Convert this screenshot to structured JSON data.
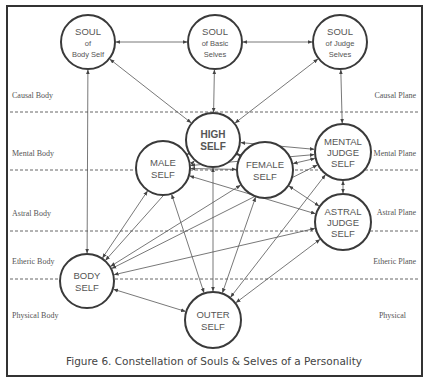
{
  "caption": "Figure 6.  Constellation of Souls & Selves of a Personality",
  "left_labels": [
    {
      "text": "Causal Body",
      "x": 12,
      "y": 98
    },
    {
      "text": "Mental Body",
      "x": 12,
      "y": 156
    },
    {
      "text": "Astral Body",
      "x": 12,
      "y": 216
    },
    {
      "text": "Etheric Body",
      "x": 12,
      "y": 264
    },
    {
      "text": "Physical Body",
      "x": 12,
      "y": 318
    }
  ],
  "right_labels": [
    {
      "text": "Causal Plane",
      "x": 416,
      "y": 98
    },
    {
      "text": "Mental Plane",
      "x": 416,
      "y": 156
    },
    {
      "text": "Astral Plane",
      "x": 416,
      "y": 215
    },
    {
      "text": "Etheric Plane",
      "x": 416,
      "y": 264
    },
    {
      "text": "Physical",
      "x": 406,
      "y": 318
    }
  ],
  "dashed_lines_y": [
    112,
    170,
    231,
    279
  ],
  "nodes": [
    {
      "id": "soul-body",
      "lines": [
        "SOUL",
        "of",
        "Body Self"
      ],
      "cx": 88,
      "cy": 42,
      "r": 27,
      "bold": false
    },
    {
      "id": "soul-basic",
      "lines": [
        "SOUL",
        "of Basic",
        "Selves"
      ],
      "cx": 215,
      "cy": 42,
      "r": 27,
      "bold": false
    },
    {
      "id": "soul-judge",
      "lines": [
        "SOUL",
        "of Judge",
        "Selves"
      ],
      "cx": 340,
      "cy": 42,
      "r": 27,
      "bold": false
    },
    {
      "id": "high-self",
      "lines": [
        "HIGH",
        "SELF"
      ],
      "cx": 213,
      "cy": 140,
      "r": 27,
      "bold": true
    },
    {
      "id": "mental-judge",
      "lines": [
        "MENTAL",
        "JUDGE",
        "SELF"
      ],
      "cx": 343,
      "cy": 152,
      "r": 28,
      "bold": false
    },
    {
      "id": "male-self",
      "lines": [
        "MALE",
        "SELF"
      ],
      "cx": 163,
      "cy": 168,
      "r": 27,
      "bold": false
    },
    {
      "id": "female-self",
      "lines": [
        "FEMALE",
        "SELF"
      ],
      "cx": 265,
      "cy": 170,
      "r": 28,
      "bold": false
    },
    {
      "id": "astral-judge",
      "lines": [
        "ASTRAL",
        "JUDGE",
        "SELF"
      ],
      "cx": 343,
      "cy": 222,
      "r": 28,
      "bold": false
    },
    {
      "id": "body-self",
      "lines": [
        "BODY",
        "SELF"
      ],
      "cx": 87,
      "cy": 281,
      "r": 27,
      "bold": false
    },
    {
      "id": "outer-self",
      "lines": [
        "OUTER",
        "SELF"
      ],
      "cx": 213,
      "cy": 320,
      "r": 28,
      "bold": false
    }
  ],
  "edges": [
    [
      "soul-body",
      "soul-basic"
    ],
    [
      "soul-basic",
      "soul-judge"
    ],
    [
      "soul-body",
      "high-self"
    ],
    [
      "soul-basic",
      "high-self"
    ],
    [
      "soul-judge",
      "high-self"
    ],
    [
      "soul-judge",
      "mental-judge"
    ],
    [
      "soul-body",
      "body-self"
    ],
    [
      "high-self",
      "male-self"
    ],
    [
      "high-self",
      "female-self"
    ],
    [
      "high-self",
      "mental-judge"
    ],
    [
      "high-self",
      "outer-self"
    ],
    [
      "mental-judge",
      "male-self"
    ],
    [
      "mental-judge",
      "female-self"
    ],
    [
      "astral-judge",
      "male-self"
    ],
    [
      "astral-judge",
      "female-self"
    ],
    [
      "female-self",
      "male-self"
    ],
    [
      "mental-judge",
      "astral-judge"
    ],
    [
      "male-self",
      "body-self"
    ],
    [
      "male-self",
      "outer-self"
    ],
    [
      "female-self",
      "body-self"
    ],
    [
      "female-self",
      "outer-self"
    ],
    [
      "mental-judge",
      "body-self"
    ],
    [
      "mental-judge",
      "outer-self"
    ],
    [
      "astral-judge",
      "body-self"
    ],
    [
      "astral-judge",
      "outer-self"
    ],
    [
      "high-self",
      "body-self"
    ],
    [
      "body-self",
      "outer-self"
    ]
  ]
}
